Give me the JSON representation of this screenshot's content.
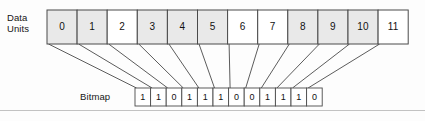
{
  "figure": {
    "labels": {
      "data_units": "Data\nUnits",
      "data_units_line1": "Data",
      "data_units_line2": "Units",
      "bitmap": "Bitmap"
    },
    "colors": {
      "shaded_cell": "#e9e9e9",
      "empty_cell": "#ffffff",
      "stroke": "#4a4a4a",
      "text": "#111111",
      "background": "#fdfdfd",
      "rule": "#b9b9b9"
    },
    "data_units": {
      "count": 12,
      "cells": [
        {
          "label": "0",
          "allocated": true
        },
        {
          "label": "1",
          "allocated": true
        },
        {
          "label": "2",
          "allocated": false
        },
        {
          "label": "3",
          "allocated": true
        },
        {
          "label": "4",
          "allocated": true
        },
        {
          "label": "5",
          "allocated": true
        },
        {
          "label": "6",
          "allocated": false
        },
        {
          "label": "7",
          "allocated": false
        },
        {
          "label": "8",
          "allocated": true
        },
        {
          "label": "9",
          "allocated": true
        },
        {
          "label": "10",
          "allocated": true
        },
        {
          "label": "11",
          "allocated": false
        }
      ]
    },
    "bitmap": {
      "count": 12,
      "bits": [
        "1",
        "1",
        "0",
        "1",
        "1",
        "1",
        "0",
        "0",
        "1",
        "1",
        "1",
        "0"
      ],
      "string": "110111001110"
    }
  }
}
